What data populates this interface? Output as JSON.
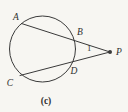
{
  "diagram": {
    "type": "circle-with-two-secants-from-external-point",
    "labels": {
      "A": "A",
      "B": "B",
      "C": "C",
      "D": "D",
      "P": "P",
      "angle": "1",
      "caption": "(c)"
    },
    "colors": {
      "line": "#3a3a3a",
      "text": "#2e2e2e",
      "background": "#f7f6f2"
    }
  }
}
